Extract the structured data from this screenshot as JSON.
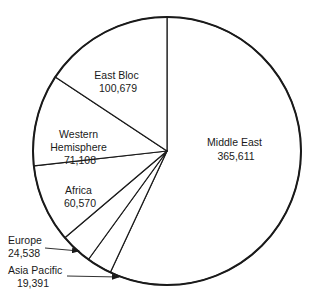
{
  "chart_data": {
    "type": "pie",
    "title": "",
    "start_angle_deg": 0,
    "direction": "clockwise",
    "total": 641897,
    "slices": [
      {
        "label": "Middle East",
        "value": 365611,
        "value_text": "365,611"
      },
      {
        "label": "Asia Pacific",
        "value": 19391,
        "value_text": "19,391"
      },
      {
        "label": "Europe",
        "value": 24538,
        "value_text": "24,538"
      },
      {
        "label": "Africa",
        "value": 60570,
        "value_text": "60,570"
      },
      {
        "label": "Western Hemisphere",
        "value": 71108,
        "value_text": "71,108"
      },
      {
        "label": "East Bloc",
        "value": 100679,
        "value_text": "100,679"
      }
    ],
    "colors": {
      "fill": "#ffffff",
      "stroke": "#1a1a1a"
    }
  },
  "labels": {
    "middle_east": {
      "line1": "Middle East",
      "line2": "365,611"
    },
    "east_bloc": {
      "line1": "East Bloc",
      "line2": "100,679"
    },
    "western": {
      "line1": "Western",
      "line2": "Hemisphere",
      "line3": "71,108"
    },
    "africa": {
      "line1": "Africa",
      "line2": "60,570"
    },
    "europe": {
      "line1": "Europe",
      "line2": "24,538"
    },
    "asia_pacific": {
      "line1": "Asia Pacific",
      "line2": "19,391"
    }
  }
}
